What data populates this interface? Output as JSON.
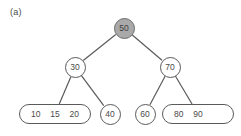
{
  "figure": {
    "panel_label": "(a)",
    "background_color": "#ffffff",
    "stroke_color": "#5a5a5a",
    "text_color": "#4a4a4a",
    "highlight_fill": "#a9a9a9"
  },
  "tree": {
    "nodes": [
      {
        "id": "root",
        "shape": "circle",
        "filled": true,
        "keys": [
          "50"
        ],
        "label": "50",
        "cx": 124,
        "cy": 28
      },
      {
        "id": "internal-left",
        "shape": "circle",
        "filled": false,
        "keys": [
          "30"
        ],
        "label": "30",
        "cx": 75,
        "cy": 67
      },
      {
        "id": "internal-right",
        "shape": "circle",
        "filled": false,
        "keys": [
          "70"
        ],
        "label": "70",
        "cx": 170,
        "cy": 67
      },
      {
        "id": "leaf-1",
        "shape": "pill",
        "filled": false,
        "keys": [
          "10",
          "15",
          "20"
        ],
        "label": "10 15 20",
        "cx": 55,
        "cy": 114,
        "width": 72
      },
      {
        "id": "leaf-2",
        "shape": "circle",
        "filled": false,
        "keys": [
          "40"
        ],
        "label": "40",
        "cx": 110,
        "cy": 114
      },
      {
        "id": "leaf-3",
        "shape": "circle",
        "filled": false,
        "keys": [
          "60"
        ],
        "label": "60",
        "cx": 145,
        "cy": 114
      },
      {
        "id": "leaf-4",
        "shape": "pill",
        "filled": false,
        "keys": [
          "80",
          "90",
          ""
        ],
        "label": "80 90",
        "cx": 198,
        "cy": 114,
        "width": 72
      }
    ],
    "edges": [
      {
        "from": "root",
        "to": "internal-left"
      },
      {
        "from": "root",
        "to": "internal-right"
      },
      {
        "from": "internal-left",
        "to": "leaf-1"
      },
      {
        "from": "internal-left",
        "to": "leaf-2"
      },
      {
        "from": "internal-right",
        "to": "leaf-3"
      },
      {
        "from": "internal-right",
        "to": "leaf-4"
      }
    ]
  }
}
